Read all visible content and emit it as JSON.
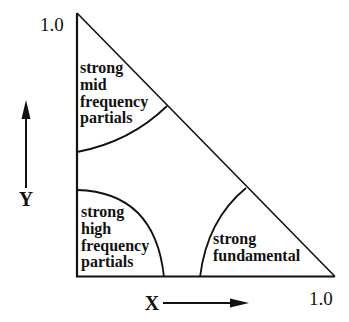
{
  "diagram": {
    "axes": {
      "y_label": "Y",
      "x_label": "X",
      "y_max_label": "1.0",
      "x_max_label": "1.0"
    },
    "regions": [
      {
        "id": "mid",
        "lines": [
          "strong",
          "mid",
          "frequency",
          "partials"
        ]
      },
      {
        "id": "high",
        "lines": [
          "strong",
          "high",
          "frequency",
          "partials"
        ]
      },
      {
        "id": "fundamental",
        "lines": [
          "strong",
          "fundamental"
        ]
      }
    ],
    "colors": {
      "stroke": "#111111",
      "background": "#ffffff"
    }
  }
}
